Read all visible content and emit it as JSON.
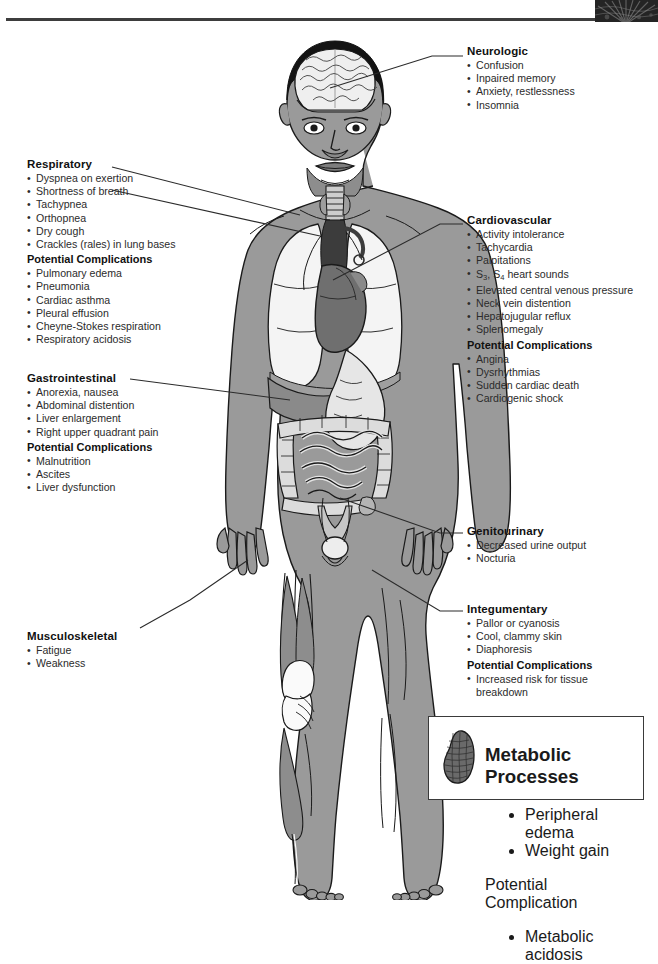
{
  "document": {
    "title": "Clinical Manifestations of Heart Failure",
    "top_right_thumbnail": "dark-tissue-photo-fragment"
  },
  "callouts": [
    {
      "id": "neurologic",
      "heading": "Neurologic",
      "items": [
        "Confusion",
        "Inpaired memory",
        "Anxiety, restlessness",
        "Insomnia"
      ],
      "complications_heading": "",
      "complications": []
    },
    {
      "id": "respiratory",
      "heading": "Respiratory",
      "items": [
        "Dyspnea on exertion",
        "Shortness of breath",
        "Tachypnea",
        "Orthopnea",
        "Dry cough",
        "Crackles (rales) in lung bases"
      ],
      "complications_heading": "Potential Complications",
      "complications": [
        "Pulmonary edema",
        "Pneumonia",
        "Cardiac asthma",
        "Pleural effusion",
        "Cheyne-Stokes respiration",
        "Respiratory acidosis"
      ]
    },
    {
      "id": "cardiovascular",
      "heading": "Cardiovascular",
      "items": [
        "Activity intolerance",
        "Tachycardia",
        "Palpitations",
        "S3, S4 heart sounds",
        "Elevated central venous pressure",
        "Neck vein distention",
        "Hepatojugular reflux",
        "Splenomegaly"
      ],
      "complications_heading": "Potential Complications",
      "complications": [
        "Angina",
        "Dysrhythmias",
        "Sudden cardiac death",
        "Cardiogenic shock"
      ]
    },
    {
      "id": "gastrointestinal",
      "heading": "Gastrointestinal",
      "items": [
        "Anorexia, nausea",
        "Abdominal distention",
        "Liver enlargement",
        "Right upper quadrant pain"
      ],
      "complications_heading": "Potential Complications",
      "complications": [
        "Malnutrition",
        "Ascites",
        "Liver dysfunction"
      ]
    },
    {
      "id": "genitourinary",
      "heading": "Genitourinary",
      "items": [
        "Decreased urine output",
        "Nocturia"
      ],
      "complications_heading": "",
      "complications": []
    },
    {
      "id": "integumentary",
      "heading": "Integumentary",
      "items": [
        "Pallor or cyanosis",
        "Cool, clammy skin",
        "Diaphoresis"
      ],
      "complications_heading": "Potential Complications",
      "complications": [
        "Increased risk for tissue\nbreakdown"
      ]
    },
    {
      "id": "musculoskeletal",
      "heading": "Musculoskeletal",
      "items": [
        "Fatigue",
        "Weakness"
      ],
      "complications_heading": "",
      "complications": []
    },
    {
      "id": "metabolic",
      "heading": "Metabolic Processes",
      "items": [
        "Peripheral edema",
        "Weight gain"
      ],
      "complications_heading": "Potential Complication",
      "complications": [
        "Metabolic acidosis"
      ],
      "icon": "kidney-icon"
    }
  ],
  "cardiovascular_heart_sounds": {
    "prefix": "S",
    "sub1": "3",
    "mid": ", S",
    "sub2": "4",
    "suffix": " heart sounds"
  },
  "figure": {
    "name": "anterior-human-body-anatomy",
    "organs": [
      "brain",
      "trachea",
      "lungs",
      "heart",
      "stomach",
      "liver",
      "small-intestine",
      "large-intestine",
      "bladder",
      "kidney",
      "leg-musculature"
    ]
  },
  "colors": {
    "skin": "#9a9a9a",
    "skin_shadow": "#858585",
    "organ_light": "#f2f2f2",
    "organ_mid": "#c9c9c9",
    "heart_dark": "#6d6d6d",
    "trachea_dark": "#3a3a3a",
    "outline": "#1a1a1a",
    "leader": "#2b2b2b",
    "text": "#2b2b2b",
    "heading": "#111111"
  }
}
